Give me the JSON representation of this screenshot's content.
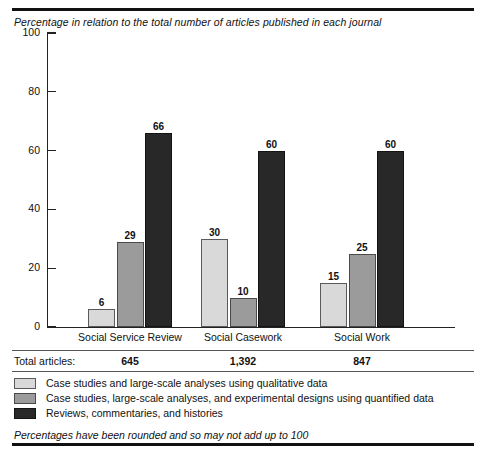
{
  "chart_data": {
    "type": "bar",
    "title": "Percentage in relation to the total number of articles published in each journal",
    "xlabel": "",
    "ylabel": "",
    "ylim": [
      0,
      100
    ],
    "yticks": [
      0,
      20,
      40,
      60,
      80,
      100
    ],
    "grid": false,
    "legend_position": "bottom",
    "categories": [
      "Social Service Review",
      "Social Casework",
      "Social Work"
    ],
    "series": [
      {
        "name": "Case studies and large-scale analyses using qualitative data",
        "color": "#d9d9d9",
        "values": [
          6,
          30,
          15
        ]
      },
      {
        "name": "Case studies, large-scale analyses, and experimental designs using quantified data",
        "color": "#9b9b9b",
        "values": [
          29,
          10,
          25
        ]
      },
      {
        "name": "Reviews, commentaries, and histories",
        "color": "#282828",
        "values": [
          66,
          60,
          60
        ]
      }
    ],
    "annotations": {
      "totals_label": "Total articles:",
      "totals": [
        "645",
        "1,392",
        "847"
      ],
      "footnote": "Percentages have been rounded and so may not add up to 100"
    }
  },
  "axis": {
    "tick_labels": [
      "100",
      "80",
      "60",
      "40",
      "20",
      "0"
    ]
  },
  "groups": [
    {
      "label": "Social Service Review",
      "total": "645"
    },
    {
      "label": "Social Casework",
      "total": "1,392"
    },
    {
      "label": "Social Work",
      "total": "847"
    }
  ],
  "legend": {
    "items": [
      {
        "label": "Case studies and large-scale analyses using qualitative data",
        "swatch": "light-gray-swatch"
      },
      {
        "label": "Case studies, large-scale analyses, and experimental designs using quantified data",
        "swatch": "medium-gray-swatch"
      },
      {
        "label": "Reviews, commentaries, and histories",
        "swatch": "dark-swatch"
      }
    ]
  },
  "totals_row": {
    "label": "Total articles:"
  },
  "footnote": {
    "text": "Percentages have been rounded and so may not add up to 100"
  },
  "colors": {
    "series1": "#d9d9d9",
    "series2": "#9b9b9b",
    "series3": "#282828",
    "rule": "#111111"
  }
}
